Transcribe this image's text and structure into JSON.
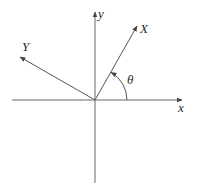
{
  "diagram": {
    "colors": {
      "line": "#555555",
      "text": "#2a2a2a",
      "background": "#ffffff"
    },
    "origin": {
      "x": 95,
      "y": 100
    },
    "axes": {
      "x": {
        "label": "x",
        "from": [
          12,
          100
        ],
        "to": [
          182,
          100
        ],
        "label_pos": [
          178,
          112
        ]
      },
      "y": {
        "label": "y",
        "from": [
          95,
          183
        ],
        "to": [
          95,
          12
        ],
        "label_pos": [
          98,
          18
        ]
      },
      "X": {
        "label": "X",
        "from": [
          95,
          100
        ],
        "to": [
          137,
          26
        ],
        "label_pos": [
          140,
          33
        ]
      },
      "Y": {
        "label": "Y",
        "from": [
          95,
          100
        ],
        "to": [
          20,
          57
        ],
        "label_pos": [
          22,
          51
        ]
      }
    },
    "angle": {
      "label": "θ",
      "radius": 32,
      "label_pos": [
        127,
        84
      ]
    }
  }
}
